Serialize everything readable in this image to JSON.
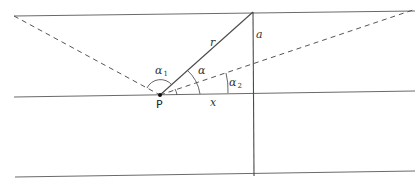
{
  "diagram": {
    "labels": {
      "point": "P",
      "radius": "r",
      "distance_vertical": "a",
      "distance_horizontal": "x",
      "angle_alpha": "α",
      "angle_alpha1_base": "α",
      "angle_alpha1_sub": "1",
      "angle_alpha2_base": "α",
      "angle_alpha2_sub": "2"
    },
    "colors": {
      "line": "#4a4a4a",
      "background": "#ffffff"
    }
  }
}
